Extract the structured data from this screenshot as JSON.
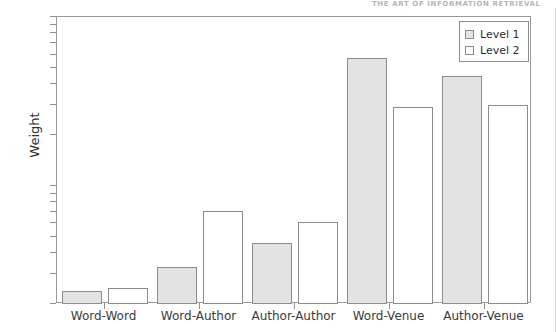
{
  "page": {
    "running_header": "THE ART OF INFORMATION RETRIEVAL"
  },
  "chart_data": {
    "type": "bar",
    "title": "",
    "xlabel": "",
    "ylabel": "Weight",
    "yscale": "log",
    "ylim": [
      0.2,
      10
    ],
    "grid": false,
    "legend_position": "top-right",
    "categories": [
      "Word-Word",
      "Word-Author",
      "Author-Author",
      "Word-Venue",
      "Author-Venue"
    ],
    "series": [
      {
        "name": "Level 1",
        "fill": "#e3e3e3",
        "values": [
          0.24,
          0.33,
          0.46,
          5.7,
          4.5
        ]
      },
      {
        "name": "Level 2",
        "fill": "#ffffff",
        "values": [
          0.25,
          0.71,
          0.61,
          2.95,
          3.0
        ]
      }
    ],
    "ytick_labels_major": [
      "10",
      "1"
    ],
    "ytick_labels_minor": [
      "9",
      "8",
      "7",
      "6",
      "5",
      "4",
      "3",
      "2"
    ],
    "yticks": [
      10,
      9,
      8,
      7,
      6,
      5,
      4,
      3,
      2,
      1,
      0.9,
      0.8,
      0.7,
      0.6,
      0.5,
      0.4,
      0.3,
      0.2
    ]
  },
  "colors": {
    "bar_stroke": "#8c8c8c",
    "level1_fill": "#e3e3e3",
    "level2_fill": "#ffffff",
    "axis": "#9a9a9a",
    "text": "#3a3a3a"
  }
}
